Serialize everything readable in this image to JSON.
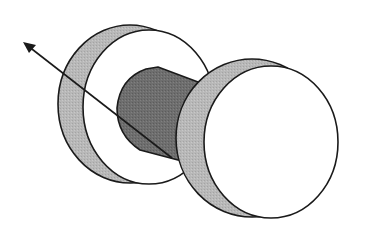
{
  "diagram": {
    "title": "",
    "colors": {
      "background": "#ffffff",
      "stroke": "#1a1a1a",
      "rim_fill": "#b8b8b8",
      "axle_fill": "#6e6e6e",
      "face_fill": "#ffffff"
    },
    "elements": [
      {
        "id": "left-disc",
        "kind": "disc"
      },
      {
        "id": "axle",
        "kind": "cylinder"
      },
      {
        "id": "right-disc",
        "kind": "disc"
      },
      {
        "id": "vector-arrow",
        "kind": "arrow",
        "from": [
          172,
          158
        ],
        "to": [
          23,
          42
        ]
      }
    ]
  }
}
